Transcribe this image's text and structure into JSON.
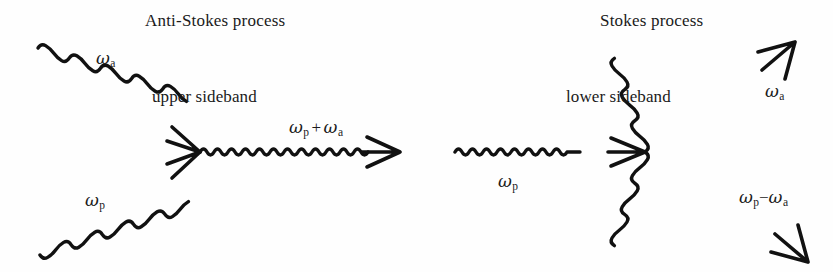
{
  "figure": {
    "kind": "feynman-style wave-mixing diagram",
    "background_color": "#fefefe",
    "ink_color": "#111111",
    "width": 833,
    "height": 272
  },
  "panels": [
    {
      "id": "anti-stokes",
      "title": "Anti-Stokes process",
      "annotation": "upper sideband",
      "inputs": [
        {
          "name": "signal-wave",
          "label_omega": "ω",
          "label_sub": "a"
        },
        {
          "name": "pump-wave",
          "label_omega": "ω",
          "label_sub": "p"
        }
      ],
      "output": {
        "name": "upper-sideband-wave",
        "expr_parts": [
          "ω",
          "p",
          "+",
          "ω",
          "a"
        ],
        "operator": "+"
      }
    },
    {
      "id": "stokes",
      "title": "Stokes process",
      "annotation": "lower sideband",
      "inputs": [
        {
          "name": "pump-wave",
          "label_omega": "ω",
          "label_sub": "p"
        }
      ],
      "outputs": [
        {
          "name": "signal-wave",
          "label_omega": "ω",
          "label_sub": "a"
        },
        {
          "name": "lower-sideband-wave",
          "expr_parts": [
            "ω",
            "p",
            "−",
            "ω",
            "a"
          ],
          "operator": "−"
        }
      ]
    }
  ],
  "labels": {
    "anti_stokes_title": "Anti-Stokes process",
    "stokes_title": "Stokes process",
    "upper_sideband": "upper sideband",
    "lower_sideband": "lower sideband",
    "omega_glyph": "ω",
    "sub_a": "a",
    "sub_p": "p",
    "plus": "+",
    "minus": "−"
  }
}
